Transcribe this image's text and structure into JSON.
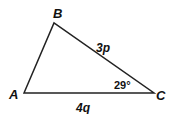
{
  "diagram": {
    "type": "triangle",
    "stroke_color": "#222222",
    "vertices": {
      "A": {
        "label": "A",
        "x": 24,
        "y": 93
      },
      "B": {
        "label": "B",
        "x": 54,
        "y": 23
      },
      "C": {
        "label": "C",
        "x": 154,
        "y": 93
      }
    },
    "sides": {
      "BC": {
        "label": "3p"
      },
      "AC": {
        "label": "4q"
      }
    },
    "angles": {
      "C": {
        "label": "29°"
      }
    }
  }
}
